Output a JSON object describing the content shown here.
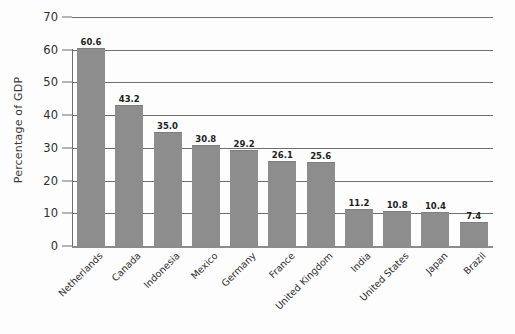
{
  "chart_data": {
    "type": "bar",
    "title": "",
    "xlabel": "",
    "ylabel": "Percentage of GDP",
    "ylim": [
      0,
      70
    ],
    "yticks": [
      "0",
      "10",
      "20",
      "30",
      "40",
      "50",
      "60",
      "70"
    ],
    "grid": true,
    "legend": "none",
    "categories": [
      "Netherlands",
      "Canada",
      "Indonesia",
      "Mexico",
      "Germany",
      "France",
      "United Kingdom",
      "India",
      "United States",
      "Japan",
      "Brazil"
    ],
    "values": [
      60.6,
      43.2,
      35.0,
      30.8,
      29.2,
      26.1,
      25.6,
      11.2,
      10.8,
      10.4,
      7.4
    ],
    "value_labels": [
      "60.6",
      "43.2",
      "35.0",
      "30.8",
      "29.2",
      "26.1",
      "25.6",
      "11.2",
      "10.8",
      "10.4",
      "7.4"
    ],
    "bar_color": "#8d8d8d",
    "axis_color": "#6f6f6f",
    "background_color": "#fdfdfd"
  }
}
